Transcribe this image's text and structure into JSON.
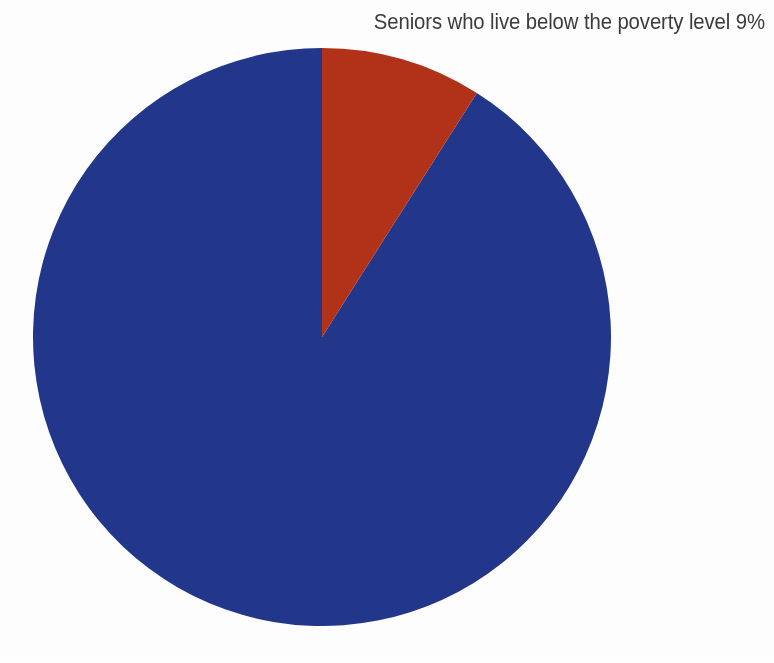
{
  "page": {
    "background_color": "#ffffff",
    "width": 774,
    "height": 663
  },
  "annotation": {
    "text": "Seniors who live below the poverty level 9%",
    "color": "#3c3c3c"
  },
  "chart_data": {
    "type": "pie",
    "title": "",
    "subtitle": "",
    "xlabel": "",
    "ylabel": "",
    "grid": false,
    "legend_position": "none",
    "units": "percent",
    "start_angle_deg": 0,
    "direction": "clockwise",
    "center": {
      "x": 322,
      "y": 337
    },
    "radius": 289,
    "labels": [
      "Seniors who live below the poverty level",
      "All other seniors"
    ],
    "values": [
      9,
      91
    ],
    "colors": [
      "#b23219",
      "#22378c"
    ],
    "slices": [
      {
        "label": "Seniors who live below the poverty level",
        "value": 9,
        "value_label": "9%",
        "color": "#b23219",
        "start_angle_deg": 0,
        "end_angle_deg": 32.4,
        "annotated": true
      },
      {
        "label": "All other seniors",
        "value": 91,
        "value_label": "",
        "color": "#22378c",
        "start_angle_deg": 32.4,
        "end_angle_deg": 360,
        "annotated": false
      }
    ],
    "annotations": [
      {
        "text": "Seniors who live below the poverty level 9%",
        "target_slice": "Seniors who live below the poverty level",
        "position": "top-right"
      }
    ]
  }
}
